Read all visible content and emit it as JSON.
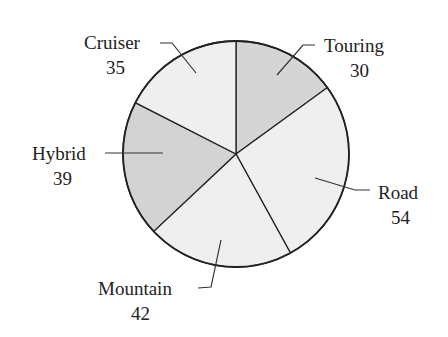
{
  "chart_data": {
    "type": "pie",
    "title": "",
    "categories": [
      "Touring",
      "Road",
      "Mountain",
      "Hybrid",
      "Cruiser"
    ],
    "values": [
      30,
      54,
      42,
      39,
      35
    ],
    "colors": [
      "#d5d5d5",
      "#efefef",
      "#efefef",
      "#d3d3d3",
      "#efefef"
    ],
    "start_angle": "12 o'clock",
    "direction": "clockwise",
    "total": 200
  },
  "labels": [
    {
      "name": "Touring",
      "value": "30"
    },
    {
      "name": "Road",
      "value": "54"
    },
    {
      "name": "Mountain",
      "value": "42"
    },
    {
      "name": "Hybrid",
      "value": "39"
    },
    {
      "name": "Cruiser",
      "value": "35"
    }
  ]
}
